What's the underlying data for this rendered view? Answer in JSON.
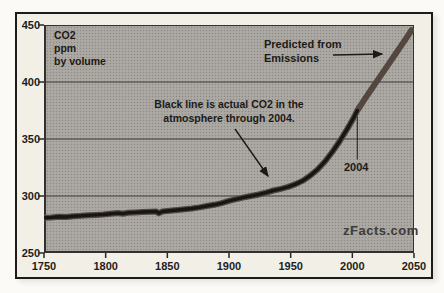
{
  "figure": {
    "watermark": "zFacts.com"
  },
  "annotations": {
    "unit": {
      "line1": "CO2",
      "line2": "ppm",
      "line3": "by volume"
    },
    "predicted": {
      "line1": "Predicted from",
      "line2": "Emissions"
    },
    "actual": {
      "line1": "Black line is actual CO2 in the",
      "line2": "atmosphere through 2004."
    },
    "year_marker": {
      "label": "2004",
      "year": 2004,
      "ppm": 375
    }
  },
  "colors": {
    "figure_background": "#f2efe7",
    "plot_background": "#a8a5a0",
    "border": "#1c1b19",
    "gridline": "#3c3a35",
    "actual_line": "#161614",
    "predicted_line": "#544740",
    "text": "#1f1d1a",
    "watermark_text": "#3d3c3a"
  },
  "chart_data": {
    "type": "line",
    "title": "",
    "xlabel": "",
    "ylabel": "CO2 ppm by volume",
    "xlim": [
      1750,
      2050
    ],
    "ylim": [
      250,
      450
    ],
    "x_ticks": [
      1750,
      1800,
      1850,
      1900,
      1950,
      2000,
      2050
    ],
    "y_ticks": [
      450,
      400,
      350,
      300,
      250
    ],
    "grid": "horizontal",
    "legend": "none",
    "series": [
      {
        "name": "Predicted from Emissions",
        "role": "predicted",
        "color": "#544740",
        "stroke_width": 6,
        "points": [
          [
            1750,
            281
          ],
          [
            1756,
            281.2
          ],
          [
            1762,
            281.8
          ],
          [
            1768,
            281.6
          ],
          [
            1774,
            282.3
          ],
          [
            1780,
            282.6
          ],
          [
            1786,
            283.2
          ],
          [
            1792,
            283.4
          ],
          [
            1798,
            283.8
          ],
          [
            1804,
            284.4
          ],
          [
            1810,
            285
          ],
          [
            1814,
            284.5
          ],
          [
            1818,
            285.3
          ],
          [
            1824,
            285.6
          ],
          [
            1830,
            286
          ],
          [
            1836,
            286.2
          ],
          [
            1841,
            286.4
          ],
          [
            1843,
            284.9
          ],
          [
            1846,
            286.4
          ],
          [
            1852,
            287.1
          ],
          [
            1858,
            287.7
          ],
          [
            1864,
            288.3
          ],
          [
            1870,
            289
          ],
          [
            1876,
            290
          ],
          [
            1882,
            291.2
          ],
          [
            1888,
            292.3
          ],
          [
            1894,
            293.8
          ],
          [
            1900,
            295.7
          ],
          [
            1906,
            297.2
          ],
          [
            1912,
            298.8
          ],
          [
            1918,
            300
          ],
          [
            1924,
            301.3
          ],
          [
            1930,
            303
          ],
          [
            1936,
            304.8
          ],
          [
            1942,
            306.3
          ],
          [
            1948,
            308
          ],
          [
            1954,
            310.4
          ],
          [
            1960,
            313.5
          ],
          [
            1966,
            318
          ],
          [
            1972,
            323.5
          ],
          [
            1978,
            330.5
          ],
          [
            1984,
            339
          ],
          [
            1990,
            348.5
          ],
          [
            1996,
            359
          ],
          [
            2001,
            368.5
          ],
          [
            2004,
            375
          ],
          [
            2010,
            385
          ],
          [
            2016,
            394.5
          ],
          [
            2022,
            404
          ],
          [
            2028,
            413.5
          ],
          [
            2034,
            423
          ],
          [
            2040,
            432.5
          ],
          [
            2045,
            440.5
          ],
          [
            2048,
            445.5
          ]
        ]
      },
      {
        "name": "Actual CO2 through 2004",
        "role": "actual",
        "color": "#161614",
        "stroke_width": 3.4,
        "points": [
          [
            1750,
            281
          ],
          [
            1756,
            281.2
          ],
          [
            1762,
            281.8
          ],
          [
            1768,
            281.6
          ],
          [
            1774,
            282.3
          ],
          [
            1780,
            282.6
          ],
          [
            1786,
            283.2
          ],
          [
            1792,
            283.4
          ],
          [
            1798,
            283.8
          ],
          [
            1804,
            284.4
          ],
          [
            1810,
            285
          ],
          [
            1814,
            284.5
          ],
          [
            1818,
            285.3
          ],
          [
            1824,
            285.6
          ],
          [
            1830,
            286
          ],
          [
            1836,
            286.2
          ],
          [
            1841,
            286.4
          ],
          [
            1843,
            284.9
          ],
          [
            1846,
            286.4
          ],
          [
            1852,
            287.1
          ],
          [
            1858,
            287.7
          ],
          [
            1864,
            288.3
          ],
          [
            1870,
            289
          ],
          [
            1876,
            290
          ],
          [
            1882,
            291.2
          ],
          [
            1888,
            292.3
          ],
          [
            1894,
            293.8
          ],
          [
            1900,
            295.7
          ],
          [
            1906,
            297.2
          ],
          [
            1912,
            298.8
          ],
          [
            1918,
            300
          ],
          [
            1924,
            301.3
          ],
          [
            1930,
            303
          ],
          [
            1936,
            304.8
          ],
          [
            1942,
            306.3
          ],
          [
            1948,
            308
          ],
          [
            1954,
            310.4
          ],
          [
            1960,
            313.5
          ],
          [
            1966,
            318
          ],
          [
            1972,
            323.5
          ],
          [
            1978,
            330.5
          ],
          [
            1984,
            339
          ],
          [
            1990,
            348.5
          ],
          [
            1996,
            359
          ],
          [
            2001,
            368.5
          ],
          [
            2004,
            375
          ]
        ]
      }
    ]
  }
}
